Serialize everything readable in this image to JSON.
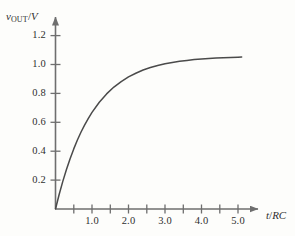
{
  "figure": {
    "background_color": "#fdfdfb",
    "axis_color": "#6e6e6e",
    "curve_color": "#4a4a4a",
    "text_color": "#2f2f2f"
  },
  "axis_titles": {
    "y_variable": "v",
    "y_subscript": "OUT",
    "y_slash": "/",
    "y_unit": "V",
    "x_numerator": "t",
    "x_slash": "/",
    "x_denominator": "RC"
  },
  "chart_data": {
    "type": "line",
    "title": "",
    "subtitle": "",
    "xlabel": "t/RC",
    "ylabel": "v_OUT/V",
    "xlim": [
      0,
      5.65
    ],
    "ylim": [
      0,
      1.33
    ],
    "grid": false,
    "legend": null,
    "x_ticks_major": [
      1.0,
      2.0,
      3.0,
      4.0,
      5.0
    ],
    "x_tick_labels": [
      "1.0",
      "2.0",
      "3.0",
      "4.0",
      "5.0"
    ],
    "x_ticks_minor": [
      0.5,
      1.5,
      2.5,
      3.5,
      4.5
    ],
    "y_ticks_major": [
      0.2,
      0.4,
      0.6,
      0.8,
      1.0,
      1.2
    ],
    "y_tick_labels": [
      "0.2",
      "0.4",
      "0.6",
      "0.8",
      "1.0",
      "1.2"
    ],
    "series": [
      {
        "name": "capacitor charging response",
        "equation": "v = 1.05 * (1 - exp(-t/RC))",
        "asymptote": 1.05,
        "x": [
          0.0,
          0.1,
          0.2,
          0.3,
          0.4,
          0.5,
          0.6,
          0.7,
          0.8,
          0.9,
          1.0,
          1.2,
          1.4,
          1.6,
          1.8,
          2.0,
          2.2,
          2.4,
          2.6,
          2.8,
          3.0,
          3.2,
          3.4,
          3.6,
          3.8,
          4.0,
          4.2,
          4.4,
          4.6,
          4.8,
          5.0,
          5.1
        ],
        "y": [
          0.0,
          0.1,
          0.19,
          0.272,
          0.346,
          0.413,
          0.474,
          0.529,
          0.578,
          0.623,
          0.664,
          0.734,
          0.791,
          0.838,
          0.876,
          0.908,
          0.933,
          0.955,
          0.972,
          0.986,
          0.998,
          1.007,
          1.015,
          1.021,
          1.027,
          1.031,
          1.034,
          1.037,
          1.04,
          1.041,
          1.043,
          1.044
        ]
      }
    ]
  },
  "tick_positions_px": {
    "origin": {
      "x": 55.5,
      "y": 209
    },
    "x_unit_px": 36.5,
    "y_unit_px": 145.5
  }
}
